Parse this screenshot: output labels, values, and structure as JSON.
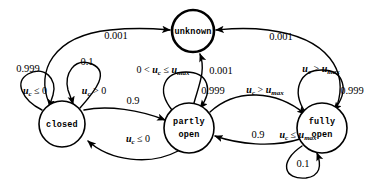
{
  "diagram": {
    "type": "state-transition-diagram",
    "title": "",
    "background_color": "#ffffff",
    "line_color": "#000000",
    "states": [
      {
        "id": "unknown",
        "label_lines": [
          "unknown"
        ],
        "cx": 193,
        "cy": 31,
        "r": 21,
        "bold_outline": true
      },
      {
        "id": "closed",
        "label_lines": [
          "closed"
        ],
        "cx": 62,
        "cy": 124,
        "r": 23,
        "bold_outline": false
      },
      {
        "id": "partly_open",
        "label_lines": [
          "partly",
          "open"
        ],
        "cx": 189,
        "cy": 128,
        "r": 25,
        "bold_outline": false
      },
      {
        "id": "fully_open",
        "label_lines": [
          "fully",
          "open"
        ],
        "cx": 322,
        "cy": 128,
        "r": 25,
        "bold_outline": false
      }
    ],
    "transitions": [
      {
        "id": "closed-to-unknown",
        "from": "closed",
        "to": "unknown",
        "probability": "0.001",
        "condition": ""
      },
      {
        "id": "fully-to-unknown",
        "from": "fully_open",
        "to": "unknown",
        "probability": "0.001",
        "condition": ""
      },
      {
        "id": "partly-to-unknown",
        "from": "partly_open",
        "to": "unknown",
        "probability": "0.001",
        "condition": ""
      },
      {
        "id": "closed-self-stay",
        "from": "closed",
        "to": "closed",
        "probability": "0.999",
        "condition": "u_c <= 0"
      },
      {
        "id": "closed-self-open",
        "from": "closed",
        "to": "closed",
        "probability": "0.1",
        "condition": "u_c > 0"
      },
      {
        "id": "closed-to-partly",
        "from": "closed",
        "to": "partly_open",
        "probability": "0.9",
        "condition": ""
      },
      {
        "id": "partly-self",
        "from": "partly_open",
        "to": "partly_open",
        "probability": "0.999",
        "condition": "0 < u_c <= u_max"
      },
      {
        "id": "partly-to-closed",
        "from": "partly_open",
        "to": "closed",
        "probability": "",
        "condition": "u_c <= 0"
      },
      {
        "id": "partly-to-fully",
        "from": "partly_open",
        "to": "fully_open",
        "probability": "",
        "condition": "u_c > u_max"
      },
      {
        "id": "fully-to-partly",
        "from": "fully_open",
        "to": "partly_open",
        "probability": "0.9",
        "condition": "u_c <= u_max"
      },
      {
        "id": "fully-self-stay",
        "from": "fully_open",
        "to": "fully_open",
        "probability": "0.999",
        "condition": "u_c > u_max"
      },
      {
        "id": "fully-self-close",
        "from": "fully_open",
        "to": "fully_open",
        "probability": "0.1",
        "condition": ""
      }
    ],
    "labels": {
      "prob_closed_unknown": "0.001",
      "prob_fully_unknown": "0.001",
      "prob_partly_unknown": "0.001",
      "prob_closed_self_stay": "0.999",
      "prob_closed_self_open": "0.1",
      "prob_closed_partly": "0.9",
      "prob_partly_self": "0.999",
      "prob_fully_partly": "0.9",
      "prob_fully_self_stay": "0.999",
      "prob_fully_self_close": "0.1",
      "node_unknown": "unknown",
      "node_closed": "closed",
      "node_partly_line1": "partly",
      "node_partly_line2": "open",
      "node_fully_line1": "fully",
      "node_fully_line2": "open"
    }
  }
}
